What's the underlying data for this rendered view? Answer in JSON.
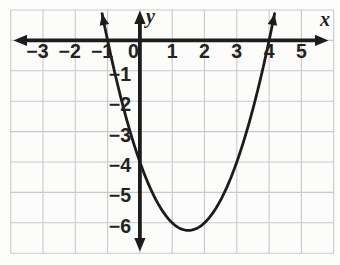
{
  "colors": {
    "axis": "#1c1c1c",
    "curve": "#1c1c1c",
    "grid": "#c6cacc",
    "text": "#222222",
    "background": "#fdfdfc",
    "plot_background": "#fcfcfa"
  },
  "chart_data": {
    "type": "line",
    "curve_kind": "parabola",
    "title": "",
    "xlabel": "x",
    "ylabel": "y",
    "grid": true,
    "x_range": [
      -4,
      6
    ],
    "y_range": [
      -7,
      1
    ],
    "x_ticks": [
      {
        "value": -3,
        "label": "−3"
      },
      {
        "value": -2,
        "label": "−2"
      },
      {
        "value": -1,
        "label": "−1"
      },
      {
        "value": 0,
        "label": "0"
      },
      {
        "value": 1,
        "label": "1"
      },
      {
        "value": 2,
        "label": "2"
      },
      {
        "value": 3,
        "label": "3"
      },
      {
        "value": 4,
        "label": "4"
      },
      {
        "value": 5,
        "label": "5"
      }
    ],
    "y_ticks": [
      {
        "value": -1,
        "label": "−1"
      },
      {
        "value": -2,
        "label": "−2"
      },
      {
        "value": -3,
        "label": "−3"
      },
      {
        "value": -4,
        "label": "−4"
      },
      {
        "value": -5,
        "label": "−5"
      },
      {
        "value": -6,
        "label": "−6"
      }
    ],
    "vertex": [
      1.5,
      -6.25
    ],
    "x_intercepts": [
      -1,
      4
    ],
    "y_intercept": [
      0,
      -4
    ],
    "points": [
      [
        -1,
        0
      ],
      [
        -0.5,
        -2.25
      ],
      [
        0,
        -4
      ],
      [
        0.5,
        -5.25
      ],
      [
        1,
        -6
      ],
      [
        1.5,
        -6.25
      ],
      [
        2,
        -6
      ],
      [
        2.5,
        -5.25
      ],
      [
        3,
        -4
      ],
      [
        3.5,
        -2.25
      ],
      [
        4,
        0
      ]
    ],
    "arrows": {
      "axis_ends": true,
      "curve_ends": true
    }
  }
}
